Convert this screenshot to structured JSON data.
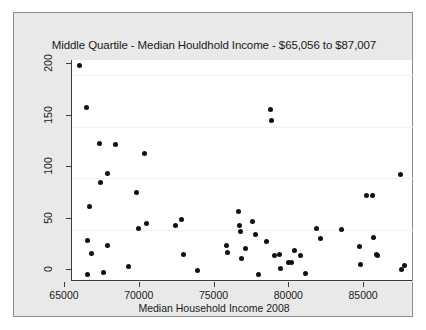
{
  "figure": {
    "background_color": "#e9e9e9",
    "panel_color": "#ffffff",
    "frame_color": "#8c8c8c",
    "point_color": "#111111"
  },
  "chart_data": {
    "type": "scatter",
    "title": "Middle Quartile - Median Houldhold Income - $65,056 to $87,007",
    "xlabel": "Median Household Income 2008",
    "ylabel": "",
    "xlim": [
      64600,
      87400
    ],
    "ylim": [
      0,
      215
    ],
    "xticks": [
      65000,
      70000,
      75000,
      80000,
      85000
    ],
    "xtick_labels": [
      "65000",
      "70000",
      "75000",
      "80000",
      "85000"
    ],
    "yticks": [
      0,
      50,
      100,
      150,
      200
    ],
    "ytick_labels": [
      "0",
      "50",
      "100",
      "150",
      "200"
    ],
    "grid": "horizontal",
    "legend": "none",
    "marker": "filled-circle",
    "points": [
      {
        "x": 65070,
        "y": 210
      },
      {
        "x": 65600,
        "y": 169
      },
      {
        "x": 65620,
        "y": 39
      },
      {
        "x": 65650,
        "y": 6
      },
      {
        "x": 65780,
        "y": 72
      },
      {
        "x": 65900,
        "y": 27
      },
      {
        "x": 66450,
        "y": 134
      },
      {
        "x": 66500,
        "y": 96
      },
      {
        "x": 66700,
        "y": 8
      },
      {
        "x": 66950,
        "y": 105
      },
      {
        "x": 67000,
        "y": 35
      },
      {
        "x": 67500,
        "y": 133
      },
      {
        "x": 68350,
        "y": 14
      },
      {
        "x": 68900,
        "y": 86
      },
      {
        "x": 69050,
        "y": 51
      },
      {
        "x": 69450,
        "y": 124
      },
      {
        "x": 69600,
        "y": 56
      },
      {
        "x": 71550,
        "y": 54
      },
      {
        "x": 71900,
        "y": 60
      },
      {
        "x": 72050,
        "y": 26
      },
      {
        "x": 73000,
        "y": 10
      },
      {
        "x": 74900,
        "y": 35
      },
      {
        "x": 75000,
        "y": 28
      },
      {
        "x": 75700,
        "y": 68
      },
      {
        "x": 75800,
        "y": 54
      },
      {
        "x": 75850,
        "y": 48
      },
      {
        "x": 75900,
        "y": 22
      },
      {
        "x": 76200,
        "y": 32
      },
      {
        "x": 76700,
        "y": 58
      },
      {
        "x": 76900,
        "y": 45
      },
      {
        "x": 77100,
        "y": 6
      },
      {
        "x": 77600,
        "y": 38
      },
      {
        "x": 77900,
        "y": 167
      },
      {
        "x": 77950,
        "y": 156
      },
      {
        "x": 78150,
        "y": 25
      },
      {
        "x": 78450,
        "y": 26
      },
      {
        "x": 78550,
        "y": 12
      },
      {
        "x": 79050,
        "y": 18
      },
      {
        "x": 79250,
        "y": 18
      },
      {
        "x": 79500,
        "y": 30
      },
      {
        "x": 79900,
        "y": 25
      },
      {
        "x": 80200,
        "y": 7
      },
      {
        "x": 80950,
        "y": 51
      },
      {
        "x": 81200,
        "y": 41
      },
      {
        "x": 82600,
        "y": 50
      },
      {
        "x": 83800,
        "y": 34
      },
      {
        "x": 83900,
        "y": 16
      },
      {
        "x": 84300,
        "y": 83
      },
      {
        "x": 84700,
        "y": 83
      },
      {
        "x": 84750,
        "y": 42
      },
      {
        "x": 84950,
        "y": 26
      },
      {
        "x": 85050,
        "y": 25
      },
      {
        "x": 86550,
        "y": 104
      },
      {
        "x": 86600,
        "y": 11
      },
      {
        "x": 86850,
        "y": 15
      }
    ]
  }
}
